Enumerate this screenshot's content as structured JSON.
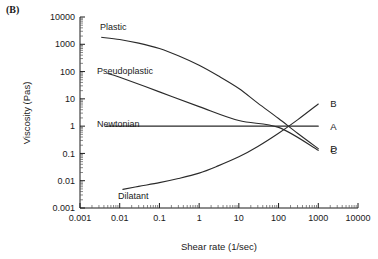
{
  "figure": {
    "panel_label": "(B)"
  },
  "chart_data": {
    "type": "line",
    "title": "",
    "xlabel": "Shear rate (1/sec)",
    "ylabel": "Viscosity (Pas)",
    "xscale": "log",
    "yscale": "log",
    "xlim": [
      0.001,
      10000
    ],
    "ylim": [
      0.001,
      10000
    ],
    "grid": false,
    "legend_position": "right-inline",
    "xticks": [
      "0.001",
      "0.01",
      "0.1",
      "1",
      "10",
      "100",
      "1000",
      "10000"
    ],
    "xtick_values": [
      0.001,
      0.01,
      0.1,
      1,
      10,
      100,
      1000,
      10000
    ],
    "yticks": [
      "0.001",
      "0.01",
      "0.1",
      "1",
      "10",
      "100",
      "1000",
      "10000"
    ],
    "ytick_values": [
      0.001,
      0.01,
      0.1,
      1,
      10,
      100,
      1000,
      10000
    ],
    "series": [
      {
        "name": "Plastic",
        "key": "D",
        "annotation": "Plastic",
        "x": [
          0.0035,
          0.01,
          0.03,
          0.1,
          0.3,
          1,
          3,
          10,
          30,
          100,
          300,
          1000
        ],
        "y": [
          1800,
          1500,
          1100,
          700,
          380,
          170,
          70,
          24,
          7,
          1.9,
          0.55,
          0.15
        ]
      },
      {
        "name": "Newtonian",
        "key": "A",
        "annotation": "Newtonian",
        "x": [
          0.0045,
          0.01,
          0.1,
          1,
          10,
          100,
          1000
        ],
        "y": [
          1,
          1,
          1,
          1,
          1,
          1,
          1
        ]
      },
      {
        "name": "Pseudoplastic",
        "key": "C",
        "annotation": "Pseudoplastic",
        "x": [
          0.005,
          0.01,
          0.1,
          1,
          10,
          100,
          1000
        ],
        "y": [
          85,
          62,
          18,
          5.2,
          1.6,
          0.9,
          0.13
        ]
      },
      {
        "name": "Dilatant",
        "key": "B",
        "annotation": "Dilatant",
        "x": [
          0.012,
          0.03,
          0.1,
          0.3,
          1,
          3,
          10,
          30,
          100,
          300,
          1000
        ],
        "y": [
          0.0048,
          0.0062,
          0.0085,
          0.012,
          0.019,
          0.035,
          0.075,
          0.18,
          0.55,
          1.7,
          6.5
        ]
      }
    ],
    "series_keys": [
      {
        "label": "D",
        "y_value": 0.15
      },
      {
        "label": "A",
        "y_value": 1
      },
      {
        "label": "C",
        "y_value": 0.13
      },
      {
        "label": "B",
        "y_value": 6.5
      }
    ]
  },
  "colors": {
    "axis": "#1a1a1a",
    "curve": "#2a2a2a",
    "background": "#ffffff"
  }
}
